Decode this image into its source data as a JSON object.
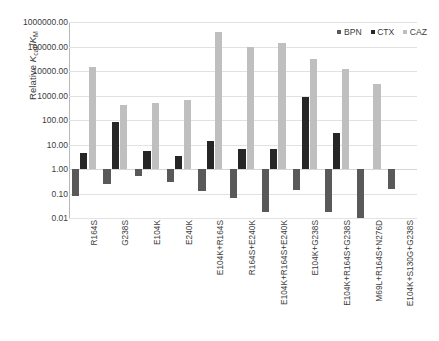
{
  "chart_data": {
    "type": "bar",
    "title": "",
    "xlabel": "",
    "ylabel": "Relative kcat/KM",
    "ylabel_rich": {
      "prefix": "Relative ",
      "italic1": "K",
      "sub1": "cat",
      "mid": "/",
      "italic2": "K",
      "sub2": "M"
    },
    "scale": "log",
    "ylim": [
      0.01,
      1000000.0
    ],
    "grid": true,
    "legend_position": "top-right",
    "baseline": 1.0,
    "ytick_labels": [
      "1000000.00",
      "100000.00",
      "10000.00",
      "1000.00",
      "100.00",
      "10.00",
      "1.00",
      "0.10",
      "0.01"
    ],
    "ytick_values": [
      1000000,
      100000,
      10000,
      1000,
      100,
      10,
      1,
      0.1,
      0.01
    ],
    "categories": [
      "R164S",
      "G238S",
      "E104K",
      "E240K",
      "E104K+R164S",
      "R164S+E240K",
      "E104K+R164S+E240K",
      "E104K+G238S",
      "E104K+R164S+G238S",
      "M69L+R164S+N276D",
      "E104K+S130G+G238S"
    ],
    "series": [
      {
        "name": "BPN",
        "color": "#595959",
        "values": [
          0.08,
          0.25,
          0.5,
          0.3,
          0.13,
          0.065,
          0.017,
          0.14,
          0.018,
          0.01,
          0.15
        ]
      },
      {
        "name": "CTX",
        "color": "#262626",
        "values": [
          4.5,
          80.0,
          5.5,
          3.5,
          14.0,
          6.5,
          6.5,
          900.0,
          30.0,
          null,
          null
        ]
      },
      {
        "name": "CAZ",
        "color": "#bfbfbf",
        "values": [
          14000.0,
          420.0,
          500.0,
          650.0,
          400000.0,
          95000.0,
          140000.0,
          30000.0,
          12000.0,
          3000.0,
          null
        ]
      }
    ]
  },
  "legend": {
    "items": [
      {
        "label": "BPN",
        "color": "#595959"
      },
      {
        "label": "CTX",
        "color": "#262626"
      },
      {
        "label": "CAZ",
        "color": "#bfbfbf"
      }
    ]
  }
}
